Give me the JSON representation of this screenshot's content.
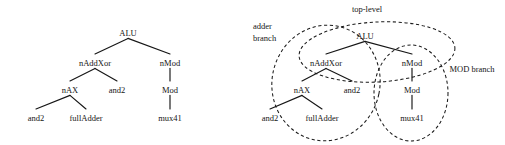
{
  "figure": {
    "title": "",
    "background_color": "#ffffff",
    "ink_color": "#161616",
    "panels": [
      {
        "id": "left-panel",
        "name": "plain-hierarchy-tree",
        "caption": "",
        "nodes": [
          {
            "id": "alu",
            "label": "ALU",
            "x": 128,
            "y": 33,
            "level": 0
          },
          {
            "id": "naddxor",
            "label": "nAddXor",
            "x": 95,
            "y": 63,
            "level": 1
          },
          {
            "id": "nmod",
            "label": "nMod",
            "x": 170,
            "y": 63,
            "level": 1
          },
          {
            "id": "nax",
            "label": "nAX",
            "x": 70,
            "y": 90,
            "level": 2
          },
          {
            "id": "and2_a",
            "label": "and2",
            "x": 117,
            "y": 90,
            "level": 2
          },
          {
            "id": "mod",
            "label": "Mod",
            "x": 170,
            "y": 90,
            "level": 2
          },
          {
            "id": "and2_b",
            "label": "and2",
            "x": 36,
            "y": 118,
            "level": 3
          },
          {
            "id": "fulladder",
            "label": "fullAdder",
            "x": 86,
            "y": 118,
            "level": 3
          },
          {
            "id": "mux41",
            "label": "mux41",
            "x": 170,
            "y": 118,
            "level": 3
          }
        ],
        "edges": [
          {
            "from": "alu",
            "to": "naddxor"
          },
          {
            "from": "alu",
            "to": "nmod"
          },
          {
            "from": "naddxor",
            "to": "nax"
          },
          {
            "from": "naddxor",
            "to": "and2_a"
          },
          {
            "from": "nmod",
            "to": "mod"
          },
          {
            "from": "nax",
            "to": "and2_b"
          },
          {
            "from": "nax",
            "to": "fulladder"
          },
          {
            "from": "mod",
            "to": "mux41"
          }
        ],
        "groups": []
      },
      {
        "id": "right-panel",
        "name": "partitioned-hierarchy-tree",
        "caption": "",
        "nodes": [
          {
            "id": "alu",
            "label": "ALU",
            "x": 365,
            "y": 36,
            "level": 0
          },
          {
            "id": "naddxor",
            "label": "nAddXor",
            "x": 326,
            "y": 63,
            "level": 1
          },
          {
            "id": "nmod",
            "label": "nMod",
            "x": 412,
            "y": 63,
            "level": 1
          },
          {
            "id": "nax",
            "label": "nAX",
            "x": 302,
            "y": 90,
            "level": 2
          },
          {
            "id": "and2_a",
            "label": "and2",
            "x": 352,
            "y": 90,
            "level": 2
          },
          {
            "id": "mod",
            "label": "Mod",
            "x": 412,
            "y": 90,
            "level": 2
          },
          {
            "id": "and2_b",
            "label": "and2",
            "x": 270,
            "y": 118,
            "level": 3
          },
          {
            "id": "fulladder",
            "label": "fullAdder",
            "x": 322,
            "y": 118,
            "level": 3
          },
          {
            "id": "mux41",
            "label": "mux41",
            "x": 412,
            "y": 118,
            "level": 3
          }
        ],
        "edges": [
          {
            "from": "alu",
            "to": "naddxor"
          },
          {
            "from": "alu",
            "to": "nmod"
          },
          {
            "from": "naddxor",
            "to": "nax"
          },
          {
            "from": "naddxor",
            "to": "and2_a"
          },
          {
            "from": "nmod",
            "to": "mod"
          },
          {
            "from": "nax",
            "to": "and2_b"
          },
          {
            "from": "nax",
            "to": "fulladder"
          },
          {
            "from": "mod",
            "to": "mux41"
          }
        ],
        "groups": [
          {
            "id": "top-level",
            "label": "top-level",
            "label_x": 367,
            "label_y": 12,
            "label_anchor": "middle",
            "shape": "ellipse",
            "cx": 377,
            "cy": 52,
            "rx": 78,
            "ry": 30,
            "rotate": -3,
            "members": [
              "alu",
              "naddxor",
              "nmod"
            ]
          },
          {
            "id": "adder-branch",
            "label": "adder branch",
            "label_lines": [
              "adder",
              "branch"
            ],
            "label_x": 253,
            "label_y": 29,
            "label_anchor": "start",
            "shape": "ellipse",
            "cx": 326,
            "cy": 83,
            "rx": 54,
            "ry": 58,
            "rotate": 12,
            "members": [
              "naddxor",
              "nax",
              "and2_a",
              "and2_b",
              "fulladder"
            ]
          },
          {
            "id": "mod-branch",
            "label": "MOD branch",
            "label_x": 472,
            "label_y": 72,
            "label_anchor": "middle",
            "shape": "ellipse",
            "cx": 411,
            "cy": 93,
            "rx": 37,
            "ry": 48,
            "rotate": 0,
            "members": [
              "nmod",
              "mod",
              "mux41"
            ]
          }
        ]
      }
    ]
  }
}
